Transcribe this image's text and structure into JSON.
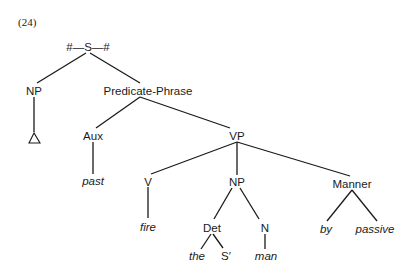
{
  "example_number": "(24)",
  "tree": {
    "root": {
      "label": "#—S—#",
      "x": 88,
      "y": 50
    },
    "nodes": {
      "np_subject": {
        "label": "NP",
        "x": 34,
        "y": 94
      },
      "predicate_phrase": {
        "label": "Predicate-Phrase",
        "x": 148,
        "y": 94
      },
      "aux": {
        "label": "Aux",
        "x": 93,
        "y": 139
      },
      "vp": {
        "label": "VP",
        "x": 237,
        "y": 139
      },
      "v": {
        "label": "V",
        "x": 148,
        "y": 185
      },
      "np_object": {
        "label": "NP",
        "x": 237,
        "y": 185
      },
      "manner": {
        "label": "Manner",
        "x": 352,
        "y": 187
      },
      "det": {
        "label": "Det",
        "x": 212,
        "y": 231
      },
      "n": {
        "label": "N",
        "x": 265,
        "y": 231
      }
    },
    "leaves": {
      "delta": {
        "label": "△",
        "x": 35,
        "y": 140
      },
      "past": {
        "label": "past",
        "x": 93,
        "y": 184
      },
      "fire": {
        "label": "fire",
        "x": 148,
        "y": 230
      },
      "by": {
        "label": "by",
        "x": 326,
        "y": 232
      },
      "passive": {
        "label": "passive",
        "x": 373,
        "y": 232
      },
      "the": {
        "label": "the",
        "x": 198,
        "y": 259
      },
      "s_prime": {
        "label": "S′",
        "x": 225,
        "y": 259
      },
      "man": {
        "label": "man",
        "x": 265,
        "y": 259
      }
    },
    "edges": [
      [
        "root",
        "np_subject"
      ],
      [
        "root",
        "predicate_phrase"
      ],
      [
        "np_subject",
        "delta"
      ],
      [
        "predicate_phrase",
        "aux"
      ],
      [
        "predicate_phrase",
        "vp"
      ],
      [
        "aux",
        "past"
      ],
      [
        "vp",
        "v"
      ],
      [
        "vp",
        "np_object"
      ],
      [
        "vp",
        "manner"
      ],
      [
        "v",
        "fire"
      ],
      [
        "np_object",
        "det"
      ],
      [
        "np_object",
        "n"
      ],
      [
        "det",
        "the"
      ],
      [
        "det",
        "s_prime"
      ],
      [
        "n",
        "man"
      ],
      [
        "manner",
        "by"
      ],
      [
        "manner",
        "passive"
      ]
    ]
  }
}
